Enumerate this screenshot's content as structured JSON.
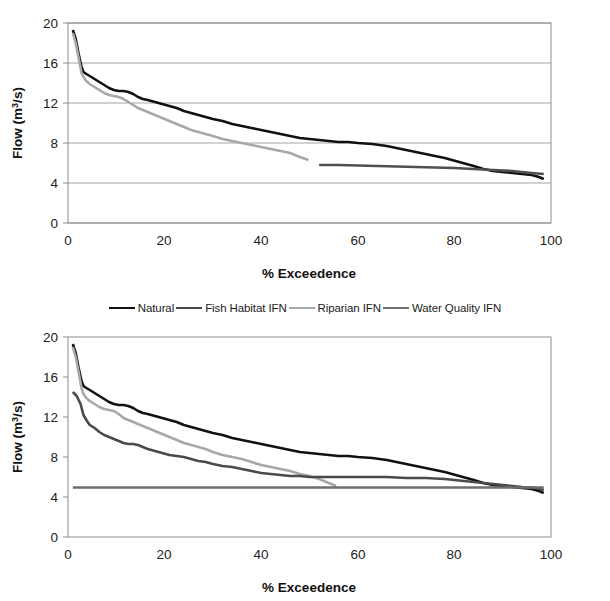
{
  "figure": {
    "kind": "two-panel-flow-duration-figure",
    "background": "#ffffff"
  },
  "legend": {
    "position": "between-panels",
    "entries": [
      {
        "label": "Natural",
        "color": "#111111",
        "width": 2.6
      },
      {
        "label": "Fish Habitat IFN",
        "color": "#4a4a4a",
        "width": 2.6
      },
      {
        "label": "Riparian IFN",
        "color": "#a8a8a8",
        "width": 2.6
      },
      {
        "label": "Water Quality IFN",
        "color": "#6e6e6e",
        "width": 2.6
      }
    ]
  },
  "chart_data": [
    {
      "id": "top-panel",
      "type": "line",
      "title": "",
      "xlabel": "% Exceedence",
      "ylabel": "Flow (m3/s)",
      "ylabel_display": "Flow (m³/s)",
      "xlim": [
        0,
        100
      ],
      "ylim": [
        0,
        20
      ],
      "xticks": [
        0,
        20,
        40,
        60,
        80,
        100
      ],
      "yticks": [
        0,
        4,
        8,
        12,
        16,
        20
      ],
      "xtick_labels": [
        "0",
        "20",
        "40",
        "60",
        "80",
        "100"
      ],
      "ytick_labels": [
        "0",
        "4",
        "8",
        "12",
        "16",
        "20"
      ],
      "grid": "horizontal",
      "legend_position": "external-below",
      "series": [
        {
          "name": "Natural",
          "color": "#111111",
          "width": 2.6,
          "x": [
            1.0,
            1.6,
            2.2,
            2.8,
            3.2,
            3.8,
            4.5,
            5.5,
            6.5,
            7.5,
            8.5,
            9.5,
            10.5,
            11.5,
            12.5,
            13.5,
            14.5,
            15.5,
            16.5,
            18.0,
            19.5,
            21.0,
            22.5,
            24.0,
            25.5,
            27.0,
            28.5,
            30.0,
            32.0,
            34.0,
            36.0,
            38.0,
            40.0,
            42.0,
            44.0,
            46.0,
            48.0,
            50.0,
            52.0,
            54.0,
            56.0,
            58.0,
            60.0,
            63.0,
            66.0,
            69.0,
            72.0,
            75.0,
            78.0,
            81.0,
            84.0,
            86.0,
            88.0,
            90.0,
            92.0,
            94.0,
            96.0,
            97.5,
            98.5
          ],
          "y": [
            19.3,
            18.4,
            16.9,
            15.6,
            15.1,
            14.9,
            14.7,
            14.4,
            14.1,
            13.8,
            13.5,
            13.3,
            13.2,
            13.2,
            13.1,
            12.9,
            12.6,
            12.4,
            12.3,
            12.1,
            11.9,
            11.7,
            11.5,
            11.2,
            11.0,
            10.8,
            10.6,
            10.4,
            10.2,
            9.9,
            9.7,
            9.5,
            9.3,
            9.1,
            8.9,
            8.7,
            8.5,
            8.4,
            8.3,
            8.2,
            8.1,
            8.1,
            8.0,
            7.9,
            7.7,
            7.4,
            7.1,
            6.8,
            6.5,
            6.1,
            5.7,
            5.4,
            5.2,
            5.1,
            5.0,
            4.9,
            4.8,
            4.6,
            4.4
          ]
        },
        {
          "name": "Riparian IFN",
          "color": "#a8a8a8",
          "width": 2.6,
          "x": [
            1.0,
            1.6,
            2.2,
            2.8,
            3.2,
            3.8,
            4.5,
            5.5,
            6.5,
            7.5,
            8.5,
            9.5,
            10.5,
            11.5,
            12.5,
            13.5,
            14.5,
            15.5,
            16.5,
            18.0,
            19.5,
            21.0,
            22.5,
            24.0,
            25.5,
            27.0,
            28.5,
            30.0,
            32.0,
            34.0,
            36.0,
            38.0,
            40.0,
            42.0,
            44.0,
            46.0,
            48.0,
            49.8
          ],
          "y": [
            19.0,
            18.0,
            16.5,
            15.0,
            14.6,
            14.2,
            13.9,
            13.6,
            13.3,
            13.0,
            12.8,
            12.7,
            12.6,
            12.4,
            12.1,
            11.8,
            11.5,
            11.3,
            11.1,
            10.8,
            10.5,
            10.2,
            9.9,
            9.6,
            9.3,
            9.1,
            8.9,
            8.7,
            8.4,
            8.2,
            8.0,
            7.8,
            7.6,
            7.4,
            7.2,
            7.0,
            6.6,
            6.3
          ]
        },
        {
          "name": "Water Quality IFN",
          "color": "#4f4f4f",
          "width": 2.6,
          "x": [
            52.0,
            56.0,
            60.0,
            64.0,
            68.0,
            72.0,
            76.0,
            80.0,
            84.0,
            88.0,
            92.0,
            96.0,
            98.5
          ],
          "y": [
            5.8,
            5.8,
            5.75,
            5.7,
            5.65,
            5.6,
            5.55,
            5.5,
            5.4,
            5.3,
            5.2,
            5.0,
            4.9
          ]
        }
      ]
    },
    {
      "id": "bottom-panel",
      "type": "line",
      "title": "",
      "xlabel": "% Exceedence",
      "ylabel": "Flow (m3/s)",
      "ylabel_display": "Flow (m³/s)",
      "xlim": [
        0,
        100
      ],
      "ylim": [
        0,
        20
      ],
      "xticks": [
        0,
        20,
        40,
        60,
        80,
        100
      ],
      "yticks": [
        0,
        4,
        8,
        12,
        16,
        20
      ],
      "xtick_labels": [
        "0",
        "20",
        "40",
        "60",
        "80",
        "100"
      ],
      "ytick_labels": [
        "0",
        "4",
        "8",
        "12",
        "16",
        "20"
      ],
      "grid": "none",
      "legend_position": "external-above",
      "series": [
        {
          "name": "Natural",
          "color": "#111111",
          "width": 2.6,
          "x": [
            1.0,
            1.6,
            2.2,
            2.8,
            3.2,
            3.8,
            4.5,
            5.5,
            6.5,
            7.5,
            8.5,
            9.5,
            10.5,
            11.5,
            12.5,
            13.5,
            14.5,
            15.5,
            16.5,
            18.0,
            19.5,
            21.0,
            22.5,
            24.0,
            25.5,
            27.0,
            28.5,
            30.0,
            32.0,
            34.0,
            36.0,
            38.0,
            40.0,
            42.0,
            44.0,
            46.0,
            48.0,
            50.0,
            52.0,
            54.0,
            56.0,
            58.0,
            60.0,
            63.0,
            66.0,
            69.0,
            72.0,
            75.0,
            78.0,
            81.0,
            84.0,
            86.0,
            88.0,
            90.0,
            92.0,
            94.0,
            96.0,
            97.5,
            98.5
          ],
          "y": [
            19.3,
            18.4,
            16.9,
            15.6,
            15.1,
            14.9,
            14.7,
            14.4,
            14.1,
            13.8,
            13.5,
            13.3,
            13.2,
            13.2,
            13.1,
            12.9,
            12.6,
            12.4,
            12.3,
            12.1,
            11.9,
            11.7,
            11.5,
            11.2,
            11.0,
            10.8,
            10.6,
            10.4,
            10.2,
            9.9,
            9.7,
            9.5,
            9.3,
            9.1,
            8.9,
            8.7,
            8.5,
            8.4,
            8.3,
            8.2,
            8.1,
            8.1,
            8.0,
            7.9,
            7.7,
            7.4,
            7.1,
            6.8,
            6.5,
            6.1,
            5.7,
            5.4,
            5.2,
            5.1,
            5.0,
            4.9,
            4.8,
            4.6,
            4.4
          ]
        },
        {
          "name": "Riparian IFN",
          "color": "#a8a8a8",
          "width": 2.6,
          "x": [
            1.0,
            1.6,
            2.2,
            2.8,
            3.2,
            3.8,
            4.5,
            5.5,
            6.5,
            7.5,
            8.5,
            9.5,
            10.5,
            11.5,
            12.5,
            13.5,
            14.5,
            15.5,
            16.5,
            18.0,
            19.5,
            21.0,
            22.5,
            24.0,
            25.5,
            27.0,
            28.5,
            30.0,
            32.0,
            34.0,
            36.0,
            38.0,
            40.0,
            42.0,
            44.0,
            46.0,
            48.0,
            50.0,
            52.0,
            54.0,
            55.5
          ],
          "y": [
            19.0,
            18.0,
            16.5,
            14.9,
            14.3,
            13.9,
            13.6,
            13.3,
            13.0,
            12.8,
            12.7,
            12.6,
            12.3,
            11.9,
            11.7,
            11.5,
            11.3,
            11.1,
            10.9,
            10.6,
            10.3,
            10.0,
            9.7,
            9.4,
            9.2,
            9.0,
            8.8,
            8.5,
            8.2,
            8.0,
            7.8,
            7.5,
            7.2,
            7.0,
            6.8,
            6.6,
            6.3,
            6.1,
            5.8,
            5.4,
            5.1
          ]
        },
        {
          "name": "Fish Habitat IFN",
          "color": "#4a4a4a",
          "width": 2.6,
          "x": [
            1.0,
            1.8,
            2.6,
            3.2,
            3.8,
            4.5,
            5.5,
            6.5,
            7.5,
            8.5,
            9.5,
            10.5,
            11.5,
            12.5,
            13.5,
            14.5,
            15.5,
            16.5,
            18.0,
            19.5,
            21.0,
            22.5,
            24.0,
            25.5,
            27.0,
            28.5,
            30.0,
            32.0,
            34.0,
            36.0,
            38.0,
            40.0,
            42.0,
            44.0,
            46.0,
            48.0,
            50.0,
            54.0,
            58.0,
            62.0,
            66.0,
            70.0,
            74.0,
            78.0,
            82.0,
            86.0,
            90.0,
            94.0,
            97.0,
            98.5
          ],
          "y": [
            14.5,
            14.1,
            13.3,
            12.2,
            11.7,
            11.2,
            10.9,
            10.5,
            10.2,
            10.0,
            9.8,
            9.6,
            9.4,
            9.3,
            9.3,
            9.2,
            9.0,
            8.8,
            8.6,
            8.4,
            8.2,
            8.1,
            8.0,
            7.8,
            7.6,
            7.5,
            7.3,
            7.1,
            7.0,
            6.8,
            6.6,
            6.4,
            6.3,
            6.2,
            6.1,
            6.1,
            6.0,
            6.0,
            6.0,
            6.0,
            6.0,
            5.9,
            5.9,
            5.8,
            5.6,
            5.4,
            5.2,
            5.0,
            4.9,
            4.7
          ]
        },
        {
          "name": "Water Quality IFN",
          "color": "#6e6e6e",
          "width": 2.6,
          "x": [
            1.0,
            20.0,
            40.0,
            60.0,
            80.0,
            98.5
          ],
          "y": [
            4.95,
            4.95,
            4.95,
            4.95,
            4.95,
            4.95
          ]
        }
      ]
    }
  ]
}
